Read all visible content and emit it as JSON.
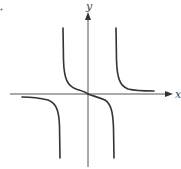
{
  "diagram": {
    "type": "function-graph",
    "axes": {
      "x_label": "x",
      "y_label": "y"
    },
    "colors": {
      "background": "#ffffff",
      "axis": "#555555",
      "curve": "#333333",
      "label": "#444444"
    },
    "features": {
      "vertical_asymptotes": 2,
      "branches": 4,
      "passes_through_origin": true,
      "horizontal_asymptote": "x-axis"
    }
  }
}
